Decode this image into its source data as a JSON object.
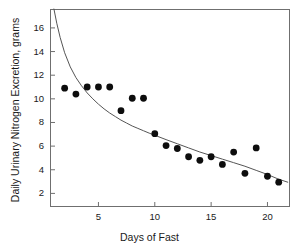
{
  "chart_data": {
    "type": "scatter",
    "title": "",
    "xlabel": "Days of Fast",
    "ylabel": "Daily Urinary Nitrogen Excretion, grams",
    "xlim": [
      0.7,
      22.0
    ],
    "ylim": [
      0.85,
      17.6
    ],
    "grid": false,
    "legend": null,
    "xticks": [
      5,
      10,
      15,
      20
    ],
    "yticks": [
      2,
      4,
      6,
      8,
      10,
      12,
      14,
      16
    ],
    "xtick_labels": [
      "5",
      "10",
      "15",
      "20"
    ],
    "ytick_labels": [
      "2",
      "4",
      "6",
      "8",
      "10",
      "12",
      "14",
      "16"
    ],
    "marker": {
      "shape": "filled-circle",
      "color": "#0d0d0d",
      "radius_px": 3.4
    },
    "series": [
      {
        "name": "Daily urinary nitrogen excretion",
        "kind": "scatter",
        "x": [
          2,
          3,
          4,
          5,
          6,
          7,
          8,
          9,
          10,
          11,
          12,
          13,
          14,
          15,
          16,
          17,
          18,
          19,
          20,
          21
        ],
        "y": [
          10.9,
          10.4,
          11.0,
          11.0,
          11.0,
          9.0,
          10.05,
          10.05,
          7.05,
          6.05,
          5.8,
          5.1,
          4.8,
          5.1,
          4.45,
          5.5,
          3.7,
          5.85,
          3.45,
          2.95
        ],
        "points": [
          {
            "x": 2,
            "y": 10.9
          },
          {
            "x": 3,
            "y": 10.4
          },
          {
            "x": 4,
            "y": 11.0
          },
          {
            "x": 5,
            "y": 11.0
          },
          {
            "x": 6,
            "y": 11.0
          },
          {
            "x": 7,
            "y": 9.0
          },
          {
            "x": 8,
            "y": 10.05
          },
          {
            "x": 9,
            "y": 10.05
          },
          {
            "x": 10,
            "y": 7.05
          },
          {
            "x": 11,
            "y": 6.05
          },
          {
            "x": 12,
            "y": 5.8
          },
          {
            "x": 13,
            "y": 5.1
          },
          {
            "x": 14,
            "y": 4.8
          },
          {
            "x": 15,
            "y": 5.1
          },
          {
            "x": 16,
            "y": 4.45
          },
          {
            "x": 17,
            "y": 5.5
          },
          {
            "x": 18,
            "y": 3.7
          },
          {
            "x": 19,
            "y": 5.85
          },
          {
            "x": 20,
            "y": 3.45
          },
          {
            "x": 21,
            "y": 2.95
          }
        ]
      },
      {
        "name": "Fitted decay curve",
        "kind": "line",
        "color": "#555555",
        "width_px": 1,
        "x": [
          1.05,
          1.3,
          1.6,
          2.0,
          2.5,
          3.0,
          3.5,
          4.0,
          4.5,
          5.0,
          5.5,
          6.0,
          6.5,
          7.0,
          7.5,
          8.0,
          8.5,
          9.0,
          9.5,
          10.0,
          11.0,
          12.0,
          13.0,
          14.0,
          15.0,
          16.0,
          17.0,
          18.0,
          19.0,
          20.0,
          21.0,
          21.8
        ],
        "y": [
          17.6,
          16.4,
          15.2,
          13.9,
          12.7,
          11.8,
          11.1,
          10.5,
          10.0,
          9.55,
          9.15,
          8.8,
          8.5,
          8.2,
          7.95,
          7.7,
          7.5,
          7.3,
          7.1,
          6.92,
          6.55,
          6.2,
          5.85,
          5.5,
          5.2,
          4.9,
          4.6,
          4.3,
          3.95,
          3.6,
          3.2,
          2.95
        ]
      }
    ]
  },
  "axes": {
    "x_title": "Days of Fast",
    "y_title": "Daily Urinary Nitrogen Excretion, grams"
  }
}
